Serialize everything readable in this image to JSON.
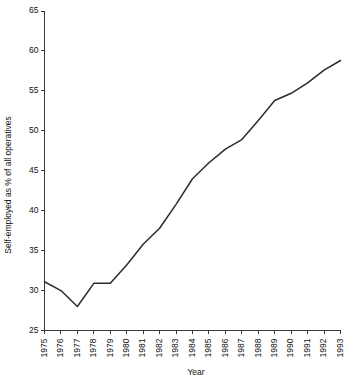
{
  "chart_data": {
    "type": "line",
    "title": "",
    "subtitle": "",
    "xlabel": "Year",
    "ylabel": "Self-employed as % of all operatives",
    "x": [
      1975,
      1976,
      1977,
      1978,
      1979,
      1980,
      1981,
      1982,
      1983,
      1984,
      1985,
      1986,
      1987,
      1988,
      1989,
      1990,
      1991,
      1992,
      1993
    ],
    "categories": [
      "1975",
      "1976",
      "1977",
      "1978",
      "1979",
      "1980",
      "1981",
      "1982",
      "1983",
      "1984",
      "1985",
      "1986",
      "1987",
      "1988",
      "1989",
      "1990",
      "1991",
      "1992",
      "1993"
    ],
    "values": [
      31.1,
      30.0,
      28.0,
      30.9,
      30.9,
      33.2,
      35.8,
      37.8,
      40.8,
      44.0,
      46.0,
      47.7,
      48.9,
      51.3,
      53.8,
      54.7,
      56.0,
      57.6,
      58.8
    ],
    "series": [
      {
        "name": "Self-employed as % of all operatives",
        "values": [
          31.1,
          30.0,
          28.0,
          30.9,
          30.9,
          33.2,
          35.8,
          37.8,
          40.8,
          44.0,
          46.0,
          47.7,
          48.9,
          51.3,
          53.8,
          54.7,
          56.0,
          57.6,
          58.8
        ]
      }
    ],
    "xlim": [
      1975,
      1993
    ],
    "ylim": [
      25,
      65
    ],
    "ytick_labels": [
      "25",
      "30",
      "35",
      "40",
      "45",
      "50",
      "55",
      "60",
      "65"
    ],
    "ytick_values": [
      25,
      30,
      35,
      40,
      45,
      50,
      55,
      60,
      65
    ],
    "grid": false,
    "legend": false,
    "legend_position": "none",
    "line_color": "#2b2b2b",
    "axis_color": "#3a3a3a",
    "background_color": "#ffffff"
  },
  "axes": {
    "y_title": "Self-employed as % of all operatives",
    "x_title": "Year"
  }
}
